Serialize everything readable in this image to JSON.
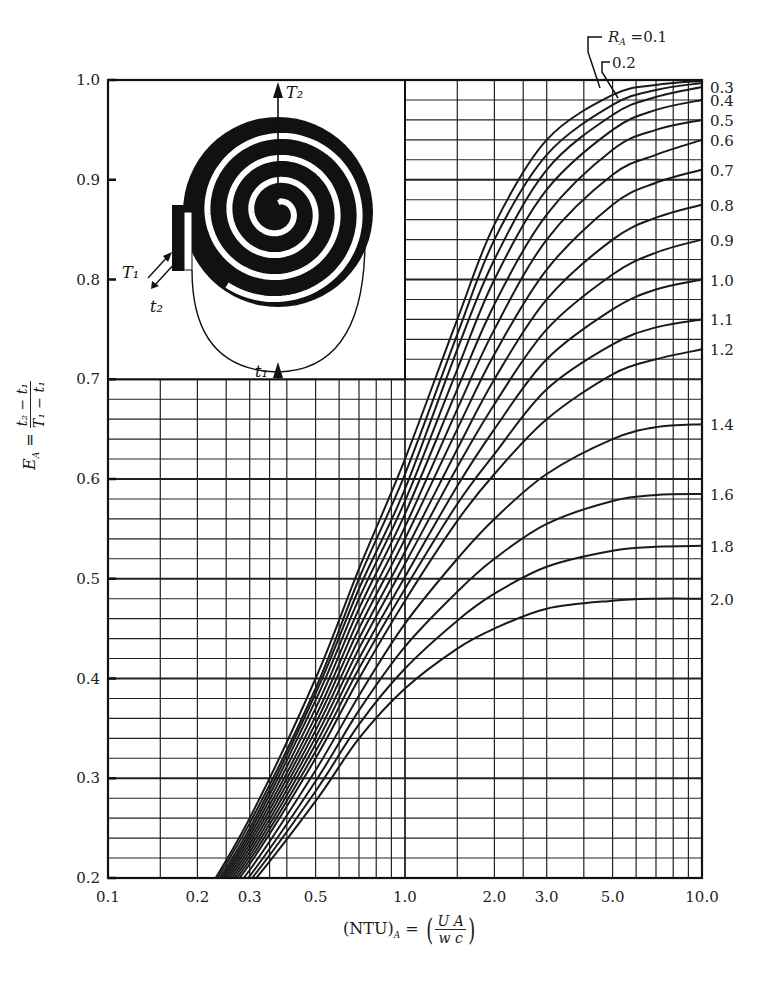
{
  "chart_data": {
    "type": "line",
    "title": "",
    "xlabel": "(NTU)_A = (U A / w c)",
    "ylabel": "E_A = (t2 - t1)/(T1 - t1)",
    "xscale": "log",
    "xlim": [
      0.1,
      10.0
    ],
    "ylim": [
      0.2,
      1.0
    ],
    "x_ticks": [
      "0.1",
      "0.2",
      "0.3",
      "0.5",
      "1.0",
      "2.0",
      "3.0",
      "5.0",
      "10.0"
    ],
    "y_ticks": [
      "0.2",
      "0.3",
      "0.4",
      "0.5",
      "0.6",
      "0.7",
      "0.8",
      "0.9",
      "1.0"
    ],
    "grid": true,
    "legend_position": "right-edge labels",
    "x": [
      0.2,
      0.3,
      0.5,
      0.7,
      1.0,
      1.5,
      2.0,
      3.0,
      5.0,
      7.0,
      10.0
    ],
    "series": [
      {
        "name": "R_A = 0.1",
        "label": "R_A=0.1",
        "values": [
          0.17,
          0.26,
          0.4,
          0.51,
          0.62,
          0.76,
          0.855,
          0.94,
          0.985,
          0.995,
          0.999
        ]
      },
      {
        "name": "R_A = 0.2",
        "label": "0.2",
        "values": [
          0.168,
          0.255,
          0.39,
          0.5,
          0.605,
          0.745,
          0.84,
          0.925,
          0.975,
          0.99,
          0.997
        ]
      },
      {
        "name": "R_A = 0.3",
        "label": "0.3",
        "values": [
          0.166,
          0.25,
          0.385,
          0.49,
          0.59,
          0.73,
          0.82,
          0.91,
          0.965,
          0.983,
          0.993
        ]
      },
      {
        "name": "R_A = 0.4",
        "label": "0.4",
        "values": [
          0.164,
          0.246,
          0.378,
          0.48,
          0.578,
          0.71,
          0.8,
          0.89,
          0.95,
          0.97,
          0.98
        ]
      },
      {
        "name": "R_A = 0.5",
        "label": "0.5",
        "values": [
          0.162,
          0.242,
          0.37,
          0.47,
          0.565,
          0.69,
          0.775,
          0.865,
          0.93,
          0.95,
          0.96
        ]
      },
      {
        "name": "R_A = 0.6",
        "label": "0.6",
        "values": [
          0.16,
          0.238,
          0.362,
          0.46,
          0.552,
          0.67,
          0.75,
          0.84,
          0.905,
          0.925,
          0.94
        ]
      },
      {
        "name": "R_A = 0.7",
        "label": "0.7",
        "values": [
          0.158,
          0.234,
          0.355,
          0.45,
          0.54,
          0.65,
          0.725,
          0.81,
          0.875,
          0.897,
          0.91
        ]
      },
      {
        "name": "R_A = 0.8",
        "label": "0.8",
        "values": [
          0.156,
          0.23,
          0.348,
          0.44,
          0.527,
          0.63,
          0.7,
          0.78,
          0.84,
          0.862,
          0.875
        ]
      },
      {
        "name": "R_A = 0.9",
        "label": "0.9",
        "values": [
          0.154,
          0.226,
          0.341,
          0.43,
          0.515,
          0.612,
          0.675,
          0.75,
          0.805,
          0.827,
          0.84
        ]
      },
      {
        "name": "R_A = 1.0",
        "label": "1.0",
        "values": [
          0.152,
          0.222,
          0.334,
          0.42,
          0.502,
          0.593,
          0.65,
          0.72,
          0.77,
          0.79,
          0.8
        ]
      },
      {
        "name": "R_A = 1.1",
        "label": "1.1",
        "values": [
          0.15,
          0.218,
          0.327,
          0.41,
          0.49,
          0.575,
          0.625,
          0.69,
          0.735,
          0.752,
          0.76
        ]
      },
      {
        "name": "R_A = 1.2",
        "label": "1.2",
        "values": [
          0.148,
          0.214,
          0.32,
          0.4,
          0.478,
          0.558,
          0.605,
          0.66,
          0.705,
          0.72,
          0.73
        ]
      },
      {
        "name": "R_A = 1.4",
        "label": "1.4",
        "values": [
          0.145,
          0.208,
          0.308,
          0.383,
          0.455,
          0.52,
          0.56,
          0.605,
          0.64,
          0.652,
          0.655
        ]
      },
      {
        "name": "R_A = 1.6",
        "label": "1.6",
        "values": [
          0.142,
          0.202,
          0.297,
          0.368,
          0.432,
          0.487,
          0.52,
          0.555,
          0.578,
          0.584,
          0.585
        ]
      },
      {
        "name": "R_A = 1.8",
        "label": "1.8",
        "values": [
          0.139,
          0.197,
          0.287,
          0.354,
          0.41,
          0.458,
          0.485,
          0.512,
          0.528,
          0.532,
          0.533
        ]
      },
      {
        "name": "R_A = 2.0",
        "label": "2.0",
        "values": [
          0.136,
          0.192,
          0.277,
          0.34,
          0.39,
          0.43,
          0.45,
          0.47,
          0.478,
          0.48,
          0.48
        ]
      }
    ],
    "annotations": [
      "R_A=0.1",
      "0.2",
      "T2",
      "T1",
      "t2",
      "t1",
      "spiral heat exchanger inset diagram"
    ]
  },
  "axis": {
    "y_label_main": "E",
    "y_label_sub": "A",
    "y_label_eq": "=",
    "y_num": "t₂ − t₁",
    "y_den": "T₁ − t₁",
    "x_label_main": "(NTU)",
    "x_label_sub": "A",
    "x_label_eq": "=",
    "x_num": "U A",
    "x_den": "w c"
  },
  "inset": {
    "T2_label": "T₂",
    "T1_label": "T₁",
    "t2_label": "t₂",
    "t1_label": "t₁"
  }
}
